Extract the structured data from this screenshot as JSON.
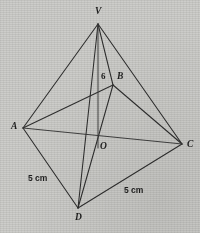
{
  "figure": {
    "kind": "geometry-diagram",
    "background_color": "#cdcdca",
    "ink_color": "#2e2e2e",
    "width": 200,
    "height": 233,
    "vertices": [
      {
        "id": "V",
        "label": "V",
        "x": 98,
        "y": 24,
        "label_x": 95,
        "label_y": 7
      },
      {
        "id": "B",
        "label": "B",
        "x": 113,
        "y": 85,
        "label_x": 117,
        "label_y": 72
      },
      {
        "id": "A",
        "label": "A",
        "x": 23,
        "y": 128,
        "label_x": 11,
        "label_y": 122
      },
      {
        "id": "C",
        "label": "C",
        "x": 182,
        "y": 144,
        "label_x": 187,
        "label_y": 140
      },
      {
        "id": "O",
        "label": "O",
        "x": 98,
        "y": 141,
        "label_x": 100,
        "label_y": 142
      },
      {
        "id": "D",
        "label": "D",
        "x": 78,
        "y": 208,
        "label_x": 75,
        "label_y": 213
      }
    ],
    "edges": [
      {
        "from": "V",
        "to": "A"
      },
      {
        "from": "V",
        "to": "B"
      },
      {
        "from": "V",
        "to": "C"
      },
      {
        "from": "V",
        "to": "D"
      },
      {
        "from": "V",
        "to": "O"
      },
      {
        "from": "A",
        "to": "B"
      },
      {
        "from": "A",
        "to": "C"
      },
      {
        "from": "A",
        "to": "D"
      },
      {
        "from": "B",
        "to": "C"
      },
      {
        "from": "B",
        "to": "D"
      },
      {
        "from": "D",
        "to": "C"
      }
    ],
    "measurements": [
      {
        "id": "height",
        "text": "6",
        "x": 101,
        "y": 72,
        "applies_to": "VO"
      },
      {
        "id": "edge-ad",
        "text": "5 cm",
        "x": 28,
        "y": 174,
        "applies_to": "AD"
      },
      {
        "id": "edge-dc",
        "text": "5 cm",
        "x": 124,
        "y": 186,
        "applies_to": "DC"
      }
    ]
  }
}
